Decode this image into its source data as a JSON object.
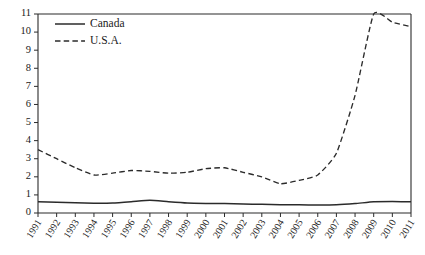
{
  "chart_data": {
    "type": "line",
    "title": "",
    "subtitle": "",
    "xlabel": "",
    "ylabel": "",
    "xlim": [
      1991,
      2011
    ],
    "ylim": [
      0,
      11
    ],
    "yticks": [
      0,
      1,
      2,
      3,
      4,
      5,
      6,
      7,
      8,
      9,
      10,
      11
    ],
    "grid": false,
    "legend_position": "top-left",
    "categories": [
      "1991",
      "1992",
      "1993",
      "1994",
      "1995",
      "1996",
      "1997",
      "1998",
      "1999",
      "2000",
      "2001",
      "2002",
      "2003",
      "2004",
      "2005",
      "2006",
      "2007",
      "2008",
      "2009",
      "2010",
      "2011"
    ],
    "x": [
      1991,
      1992,
      1993,
      1994,
      1995,
      1996,
      1997,
      1998,
      1999,
      2000,
      2001,
      2002,
      2003,
      2004,
      2005,
      2006,
      2007,
      2008,
      2009,
      2010,
      2011
    ],
    "series": [
      {
        "name": "Canada",
        "style": "solid",
        "values": [
          0.62,
          0.6,
          0.56,
          0.54,
          0.55,
          0.62,
          0.7,
          0.62,
          0.55,
          0.53,
          0.52,
          0.5,
          0.48,
          0.46,
          0.45,
          0.44,
          0.45,
          0.52,
          0.62,
          0.63,
          0.62
        ]
      },
      {
        "name": "U.S.A.",
        "style": "dashed",
        "values": [
          3.5,
          3.0,
          2.5,
          2.1,
          2.2,
          2.35,
          2.3,
          2.2,
          2.25,
          2.45,
          2.5,
          2.25,
          2.0,
          1.62,
          1.8,
          2.1,
          3.3,
          6.5,
          11.0,
          10.55,
          10.3
        ]
      }
    ],
    "legend": [
      {
        "label": "Canada",
        "style": "solid"
      },
      {
        "label": "U.S.A.",
        "style": "dashed"
      }
    ]
  }
}
